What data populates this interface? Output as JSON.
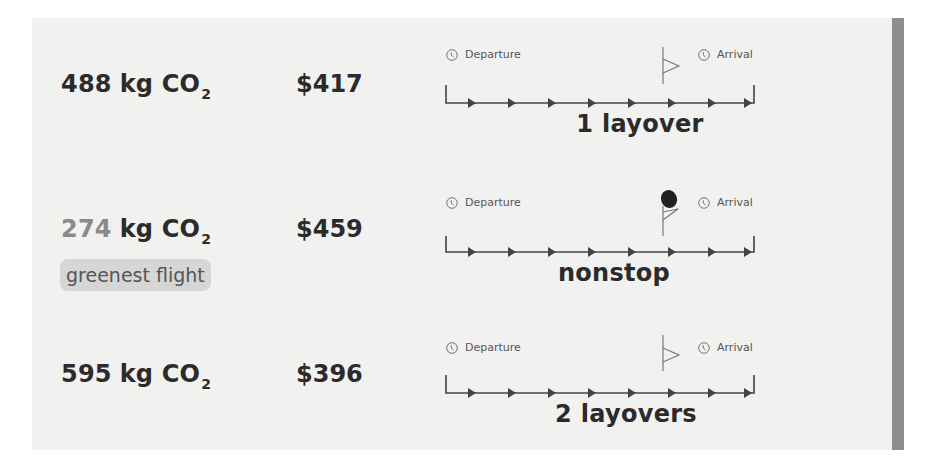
{
  "flights": [
    {
      "emission_value": "488",
      "emission_unit": "kg CO",
      "emission_subscript": "2",
      "price": "$417",
      "departure_label": "Departure",
      "arrival_label": "Arrival",
      "stops_label": "1 layover",
      "greenest": false
    },
    {
      "emission_value": "274",
      "emission_unit": "kg CO",
      "emission_subscript": "2",
      "price": "$459",
      "departure_label": "Departure",
      "arrival_label": "Arrival",
      "stops_label": "nonstop",
      "greenest": true,
      "badge_label": "greenest flight"
    },
    {
      "emission_value": "595",
      "emission_unit": "kg CO",
      "emission_subscript": "2",
      "price": "$396",
      "departure_label": "Departure",
      "arrival_label": "Arrival",
      "stops_label": "2 layovers",
      "greenest": false
    }
  ],
  "icons": {
    "clock": "clock-icon",
    "flag": "flag-icon",
    "arrow": "arrow-right-icon"
  },
  "colors": {
    "panel_bg": "#f1f1f0",
    "text": "#2b2b2b",
    "greenest_number": "#8a8a8a",
    "badge_bg": "#d6d6d6",
    "scrollbar": "#8d8d8d"
  }
}
